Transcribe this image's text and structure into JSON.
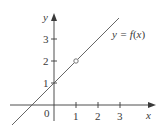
{
  "diagram": {
    "type": "function-graph",
    "curve_label": "y = f(x)",
    "curve_label_parts": {
      "lhs": "y = ",
      "f": "f",
      "open": "(",
      "x": "x",
      "close": ")"
    },
    "axes": {
      "x_label": "x",
      "y_label": "y",
      "origin_label": "0",
      "x_ticks": [
        "1",
        "2",
        "3"
      ],
      "y_ticks": [
        "1",
        "2",
        "3"
      ]
    },
    "line": {
      "equation": "y = x + 1",
      "from": [
        -1.9,
        -0.9
      ],
      "to": [
        2.9,
        3.9
      ]
    },
    "hole": {
      "x": 1,
      "y": 2,
      "style": "open-circle"
    },
    "colors": {
      "axis": "#3a3a3a",
      "line": "#555555",
      "text": "#3a3a3a",
      "background": "#ffffff"
    }
  }
}
